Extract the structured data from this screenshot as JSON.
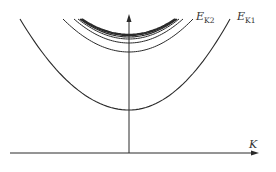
{
  "diagram": {
    "title": "",
    "axes": {
      "x_label": "K",
      "y_label": ""
    },
    "curves": [
      {
        "name": "E_K1",
        "label_main": "E",
        "label_sub": "K1",
        "vertex_y": 110,
        "x_left": 20,
        "x_right": 230,
        "top_y": 19,
        "stroke_width": 1.1
      },
      {
        "name": "E_K2",
        "label_main": "E",
        "label_sub": "K2",
        "vertex_y": 52,
        "x_left": 63,
        "x_right": 193,
        "top_y": 19,
        "stroke_width": 1.0
      },
      {
        "name": "level-3",
        "vertex_y": 43,
        "x_left": 74,
        "x_right": 183,
        "top_y": 19,
        "stroke_width": 1.0
      },
      {
        "name": "level-4",
        "vertex_y": 39,
        "x_left": 78,
        "x_right": 179,
        "top_y": 19,
        "stroke_width": 1.0
      },
      {
        "name": "level-5",
        "vertex_y": 37,
        "x_left": 80,
        "x_right": 177,
        "top_y": 19,
        "stroke_width": 1.2
      },
      {
        "name": "level-6",
        "vertex_y": 35.5,
        "x_left": 81,
        "x_right": 176,
        "top_y": 19,
        "stroke_width": 1.4
      },
      {
        "name": "level-7",
        "vertex_y": 34.5,
        "x_left": 82,
        "x_right": 175,
        "top_y": 19,
        "stroke_width": 1.6
      }
    ],
    "labels": {
      "ek2_main": "E",
      "ek2_sub": "K2",
      "ek1_main": "E",
      "ek1_sub": "K1",
      "k_axis": "K"
    }
  }
}
